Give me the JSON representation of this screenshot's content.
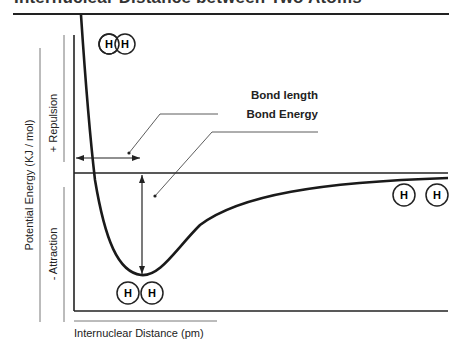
{
  "title": "Internuclear Distance between Two Atoms",
  "annotations": {
    "bond_length": "Bond length",
    "bond_energy": "Bond Energy"
  },
  "axes": {
    "y_label": "Potential Energy (KJ / mol)",
    "y_upper": "+ Repulsion",
    "y_lower": "- Attraction",
    "x_label": "Internuclear Distance (pm)"
  },
  "atoms": {
    "symbol": "H",
    "states": [
      "overlapping (too close)",
      "bonded at minimum",
      "separated (far apart)"
    ]
  },
  "colors": {
    "line": "#1a1a1a",
    "background": "#ffffff"
  }
}
